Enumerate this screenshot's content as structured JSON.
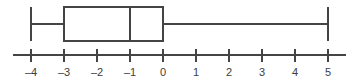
{
  "chart_data": {
    "type": "boxplot",
    "title": "",
    "xlabel": "",
    "ylabel": "",
    "orientation": "horizontal",
    "grid": false,
    "legend": null,
    "xlim": [
      -4.55,
      5.55
    ],
    "axis": {
      "tick_values": [
        -4,
        -3,
        -2,
        -1,
        0,
        1,
        2,
        3,
        4,
        5
      ],
      "tick_labels": [
        "–4",
        "–3",
        "–2",
        "–1",
        "0",
        "1",
        "2",
        "3",
        "4",
        "5"
      ],
      "tick_spacing_px": 33,
      "line_color": "#444444"
    },
    "series": [
      {
        "name": "",
        "min": -4,
        "q1": -3,
        "median": -1,
        "q3": 0,
        "max": 5,
        "iqr": 3,
        "range": 9,
        "lower_whisker_length": 1,
        "upper_whisker_length": 5,
        "outliers": [],
        "box_fill": "#ffffff",
        "box_stroke": "#444444"
      }
    ]
  },
  "figure": {
    "background": "#ffffff",
    "stroke_color": "#444444",
    "label_color": "#3c3c3c"
  }
}
